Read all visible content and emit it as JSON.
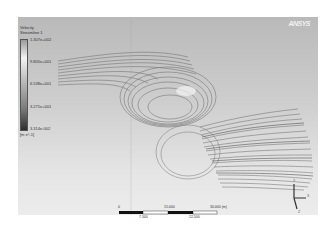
{
  "legend": {
    "title_line1": "Velocity",
    "title_line2": "Streamline 1",
    "labels": [
      "1.307e+002",
      "9.805e+001",
      "6.538e+001",
      "3.271e+001",
      "3.314e-002"
    ],
    "units": "[m s^-1]"
  },
  "logo": "ANSYS",
  "scale_bar": {
    "top_labels": [
      "0",
      "15.000",
      "30.000 (m)"
    ],
    "bottom_labels": [
      "7.500",
      "22.500"
    ]
  },
  "axes_triad": {
    "x": "X",
    "y": "Y",
    "z": "Z"
  },
  "colors": {
    "background_top": "#b9b9b9",
    "background_bottom": "#ececec",
    "streamline": "#6a6a6a"
  }
}
